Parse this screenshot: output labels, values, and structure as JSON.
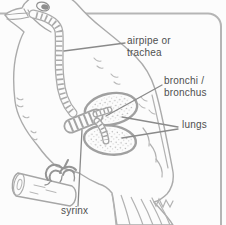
{
  "diagram": {
    "labels": {
      "trachea": "airpipe or trachea",
      "bronchi": "bronchi / bronchus",
      "lungs": "lungs",
      "syrinx": "syrinx"
    },
    "colors": {
      "background": "#fcfcfc",
      "outline": "#ababab",
      "light_detail": "#b8b8b8",
      "leader_line": "#8a8a8a",
      "label_text": "#4f4f4f",
      "frame_border": "#b5b5b5",
      "eye_fill": "#8e8e8e",
      "stipple": "#b5b5b5"
    }
  }
}
